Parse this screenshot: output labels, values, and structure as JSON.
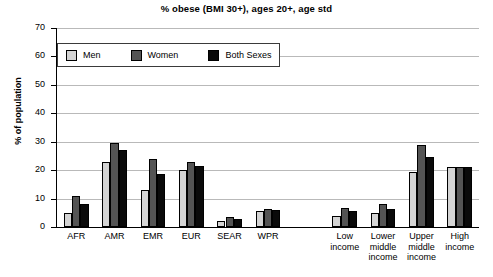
{
  "chart_data": {
    "type": "bar",
    "title": "% obese (BMI 30+), ages 20+, age std",
    "xlabel": "",
    "ylabel": "% of population",
    "ylim": [
      0,
      70
    ],
    "ytick_step": 10,
    "yticks": [
      "70",
      "60",
      "50",
      "40",
      "30",
      "20",
      "10",
      "0"
    ],
    "grid": true,
    "legend_position": "top-left-inside",
    "categories": [
      "AFR",
      "AMR",
      "EMR",
      "EUR",
      "SEAR",
      "WPR",
      "Low income",
      "Lower middle income",
      "Upper middle income",
      "High income"
    ],
    "category_lines": [
      [
        "AFR"
      ],
      [
        "AMR"
      ],
      [
        "EMR"
      ],
      [
        "EUR"
      ],
      [
        "SEAR"
      ],
      [
        "WPR"
      ],
      [
        "Low",
        "income"
      ],
      [
        "Lower",
        "middle",
        "income"
      ],
      [
        "Upper",
        "middle",
        "income"
      ],
      [
        "High",
        "income"
      ]
    ],
    "gap_after_index": 5,
    "series": [
      {
        "name": "Men",
        "color": "#d4d4d4",
        "values": [
          5.0,
          23.0,
          13.0,
          20.0,
          2.0,
          5.8,
          4.0,
          5.0,
          19.5,
          21.0
        ]
      },
      {
        "name": "Women",
        "color": "#545454",
        "values": [
          10.8,
          29.5,
          24.0,
          22.8,
          3.5,
          6.5,
          6.8,
          8.0,
          28.8,
          21.0
        ]
      },
      {
        "name": "Both Sexes",
        "color": "#0a0a0a",
        "values": [
          8.0,
          27.0,
          18.5,
          21.5,
          2.7,
          5.9,
          5.8,
          6.5,
          24.5,
          21.0
        ]
      }
    ]
  }
}
